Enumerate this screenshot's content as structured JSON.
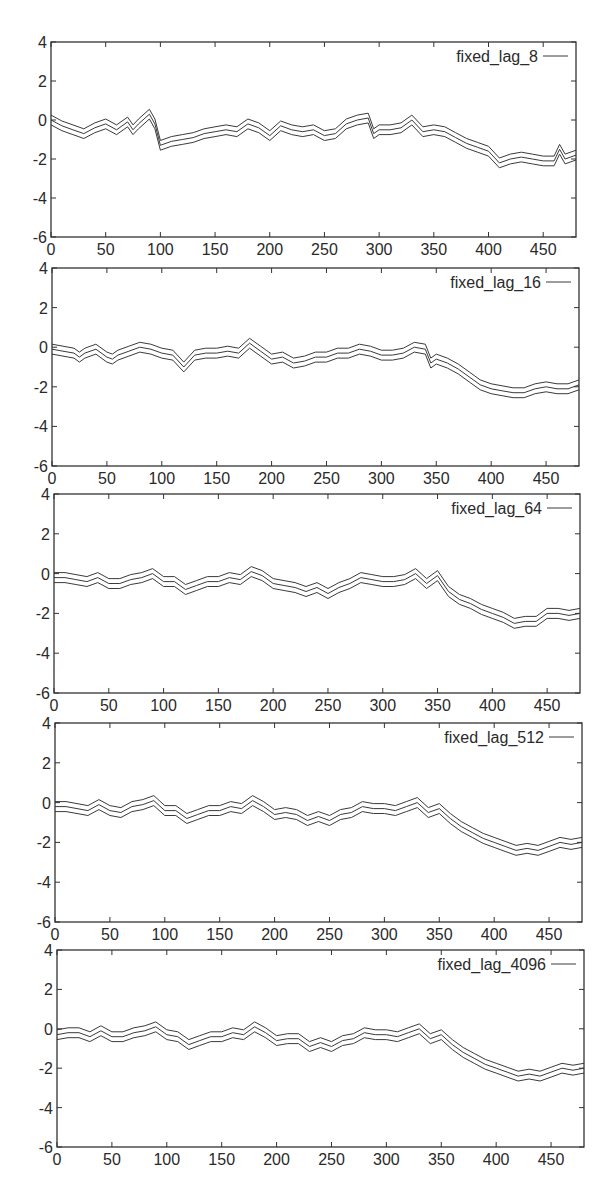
{
  "chart_data": [
    {
      "type": "line",
      "title": "",
      "legend": [
        "fixed_lag_8"
      ],
      "legend_position": "top-right",
      "xlabel": "",
      "ylabel": "",
      "xlim": [
        0,
        480
      ],
      "ylim": [
        -6,
        4
      ],
      "xticks": [
        0,
        50,
        100,
        150,
        200,
        250,
        300,
        350,
        400,
        450
      ],
      "yticks": [
        4,
        2,
        0,
        -2,
        -4,
        -6
      ],
      "grid": false,
      "band_offset": 0.25,
      "x": [
        0,
        10,
        20,
        30,
        40,
        50,
        60,
        70,
        75,
        80,
        90,
        95,
        100,
        110,
        120,
        130,
        140,
        150,
        160,
        170,
        180,
        190,
        200,
        210,
        220,
        230,
        240,
        250,
        260,
        270,
        280,
        290,
        295,
        300,
        310,
        320,
        330,
        340,
        350,
        360,
        370,
        380,
        390,
        400,
        410,
        420,
        430,
        440,
        450,
        460,
        465,
        470,
        480
      ],
      "series": [
        {
          "name": "fixed_lag_8",
          "values": [
            0.0,
            -0.3,
            -0.5,
            -0.7,
            -0.4,
            -0.2,
            -0.5,
            -0.1,
            -0.5,
            -0.2,
            0.3,
            -0.2,
            -1.3,
            -1.1,
            -1.0,
            -0.9,
            -0.7,
            -0.6,
            -0.5,
            -0.6,
            -0.2,
            -0.4,
            -0.8,
            -0.3,
            -0.5,
            -0.6,
            -0.5,
            -0.8,
            -0.7,
            -0.2,
            0.0,
            0.1,
            -0.7,
            -0.5,
            -0.5,
            -0.4,
            0.0,
            -0.6,
            -0.5,
            -0.6,
            -0.9,
            -1.2,
            -1.4,
            -1.6,
            -2.2,
            -2.0,
            -1.9,
            -2.0,
            -2.1,
            -2.1,
            -1.5,
            -2.0,
            -1.8
          ]
        }
      ]
    },
    {
      "type": "line",
      "title": "",
      "legend": [
        "fixed_lag_16"
      ],
      "legend_position": "top-right",
      "xlabel": "",
      "ylabel": "",
      "xlim": [
        0,
        480
      ],
      "ylim": [
        -6,
        4
      ],
      "xticks": [
        0,
        50,
        100,
        150,
        200,
        250,
        300,
        350,
        400,
        450
      ],
      "yticks": [
        4,
        2,
        0,
        -2,
        -4,
        -6
      ],
      "grid": false,
      "band_offset": 0.25,
      "x": [
        0,
        10,
        20,
        25,
        30,
        40,
        50,
        55,
        60,
        70,
        80,
        90,
        100,
        110,
        120,
        130,
        140,
        150,
        160,
        170,
        180,
        190,
        200,
        210,
        220,
        230,
        240,
        250,
        260,
        270,
        280,
        290,
        300,
        310,
        320,
        330,
        340,
        345,
        350,
        360,
        370,
        380,
        390,
        400,
        410,
        420,
        430,
        440,
        450,
        460,
        470,
        480
      ],
      "series": [
        {
          "name": "fixed_lag_16",
          "values": [
            -0.1,
            -0.2,
            -0.3,
            -0.5,
            -0.3,
            -0.1,
            -0.5,
            -0.6,
            -0.4,
            -0.2,
            0.0,
            -0.1,
            -0.3,
            -0.4,
            -1.0,
            -0.4,
            -0.3,
            -0.3,
            -0.2,
            -0.3,
            0.2,
            -0.2,
            -0.6,
            -0.5,
            -0.8,
            -0.7,
            -0.5,
            -0.5,
            -0.3,
            -0.3,
            -0.1,
            -0.2,
            -0.4,
            -0.4,
            -0.3,
            0.0,
            -0.1,
            -0.8,
            -0.6,
            -0.8,
            -1.1,
            -1.5,
            -1.9,
            -2.1,
            -2.2,
            -2.3,
            -2.3,
            -2.1,
            -2.0,
            -2.1,
            -2.1,
            -1.9
          ]
        }
      ]
    },
    {
      "type": "line",
      "title": "",
      "legend": [
        "fixed_lag_64"
      ],
      "legend_position": "top-right",
      "xlabel": "",
      "ylabel": "",
      "xlim": [
        0,
        480
      ],
      "ylim": [
        -6,
        4
      ],
      "xticks": [
        0,
        50,
        100,
        150,
        200,
        250,
        300,
        350,
        400,
        450
      ],
      "yticks": [
        4,
        2,
        0,
        -2,
        -4,
        -6
      ],
      "grid": false,
      "band_offset": 0.25,
      "x": [
        0,
        10,
        20,
        30,
        40,
        50,
        60,
        70,
        80,
        90,
        100,
        110,
        120,
        130,
        140,
        150,
        160,
        170,
        180,
        190,
        200,
        210,
        220,
        230,
        240,
        250,
        260,
        270,
        280,
        290,
        300,
        310,
        320,
        330,
        340,
        350,
        360,
        370,
        380,
        390,
        400,
        410,
        420,
        430,
        440,
        450,
        460,
        470,
        480
      ],
      "series": [
        {
          "name": "fixed_lag_64",
          "values": [
            -0.2,
            -0.2,
            -0.3,
            -0.4,
            -0.2,
            -0.5,
            -0.5,
            -0.3,
            -0.2,
            0.0,
            -0.4,
            -0.4,
            -0.8,
            -0.6,
            -0.4,
            -0.4,
            -0.2,
            -0.3,
            0.1,
            -0.1,
            -0.5,
            -0.6,
            -0.7,
            -0.9,
            -0.7,
            -1.0,
            -0.7,
            -0.5,
            -0.2,
            -0.3,
            -0.4,
            -0.4,
            -0.3,
            0.0,
            -0.5,
            -0.1,
            -0.9,
            -1.3,
            -1.5,
            -1.8,
            -2.0,
            -2.2,
            -2.5,
            -2.4,
            -2.4,
            -2.0,
            -2.0,
            -2.1,
            -2.0
          ]
        }
      ]
    },
    {
      "type": "line",
      "title": "",
      "legend": [
        "fixed_lag_512"
      ],
      "legend_position": "top-right",
      "xlabel": "",
      "ylabel": "",
      "xlim": [
        0,
        480
      ],
      "ylim": [
        -6,
        4
      ],
      "xticks": [
        0,
        50,
        100,
        150,
        200,
        250,
        300,
        350,
        400,
        450
      ],
      "yticks": [
        4,
        2,
        0,
        -2,
        -4,
        -6
      ],
      "grid": false,
      "band_offset": 0.25,
      "x": [
        0,
        10,
        20,
        30,
        40,
        50,
        60,
        70,
        80,
        90,
        100,
        110,
        120,
        130,
        140,
        150,
        160,
        170,
        180,
        190,
        200,
        210,
        220,
        230,
        240,
        250,
        260,
        270,
        280,
        290,
        300,
        310,
        320,
        330,
        340,
        350,
        360,
        370,
        380,
        390,
        400,
        410,
        420,
        430,
        440,
        450,
        460,
        470,
        480
      ],
      "series": [
        {
          "name": "fixed_lag_512",
          "values": [
            -0.2,
            -0.2,
            -0.3,
            -0.4,
            -0.1,
            -0.4,
            -0.5,
            -0.2,
            -0.1,
            0.1,
            -0.4,
            -0.4,
            -0.8,
            -0.6,
            -0.4,
            -0.4,
            -0.2,
            -0.3,
            0.1,
            -0.2,
            -0.6,
            -0.5,
            -0.6,
            -0.9,
            -0.7,
            -0.9,
            -0.6,
            -0.5,
            -0.2,
            -0.3,
            -0.3,
            -0.4,
            -0.2,
            0.0,
            -0.5,
            -0.3,
            -0.8,
            -1.2,
            -1.5,
            -1.8,
            -2.0,
            -2.2,
            -2.4,
            -2.3,
            -2.4,
            -2.2,
            -2.0,
            -2.1,
            -2.0
          ]
        }
      ]
    },
    {
      "type": "line",
      "title": "",
      "legend": [
        "fixed_lag_4096"
      ],
      "legend_position": "top-right",
      "xlabel": "",
      "ylabel": "",
      "xlim": [
        0,
        480
      ],
      "ylim": [
        -6,
        4
      ],
      "xticks": [
        0,
        50,
        100,
        150,
        200,
        250,
        300,
        350,
        400,
        450
      ],
      "yticks": [
        4,
        2,
        0,
        -2,
        -4,
        -6
      ],
      "grid": false,
      "band_offset": 0.25,
      "x": [
        0,
        10,
        20,
        30,
        40,
        50,
        60,
        70,
        80,
        90,
        100,
        110,
        120,
        130,
        140,
        150,
        160,
        170,
        180,
        190,
        200,
        210,
        220,
        230,
        240,
        250,
        260,
        270,
        280,
        290,
        300,
        310,
        320,
        330,
        340,
        350,
        360,
        370,
        380,
        390,
        400,
        410,
        420,
        430,
        440,
        450,
        460,
        470,
        480
      ],
      "series": [
        {
          "name": "fixed_lag_4096",
          "values": [
            -0.3,
            -0.2,
            -0.2,
            -0.4,
            -0.1,
            -0.4,
            -0.4,
            -0.2,
            -0.1,
            0.1,
            -0.3,
            -0.4,
            -0.8,
            -0.6,
            -0.4,
            -0.4,
            -0.2,
            -0.3,
            0.1,
            -0.2,
            -0.6,
            -0.5,
            -0.5,
            -0.9,
            -0.7,
            -0.9,
            -0.6,
            -0.5,
            -0.2,
            -0.3,
            -0.3,
            -0.4,
            -0.2,
            0.0,
            -0.5,
            -0.3,
            -0.8,
            -1.2,
            -1.5,
            -1.8,
            -2.0,
            -2.2,
            -2.4,
            -2.3,
            -2.4,
            -2.2,
            -2.0,
            -2.1,
            -2.0
          ]
        }
      ]
    }
  ],
  "panels": [
    {
      "legend_label": "fixed_lag_8"
    },
    {
      "legend_label": "fixed_lag_16"
    },
    {
      "legend_label": "fixed_lag_64"
    },
    {
      "legend_label": "fixed_lag_512"
    },
    {
      "legend_label": "fixed_lag_4096"
    }
  ],
  "layout": {
    "frames": [
      {
        "left": 51,
        "top": 42,
        "right": 576,
        "bottom": 237
      },
      {
        "left": 52,
        "top": 268,
        "right": 579,
        "bottom": 466
      },
      {
        "left": 54,
        "top": 494,
        "right": 580,
        "bottom": 693
      },
      {
        "left": 55,
        "top": 723,
        "right": 582,
        "bottom": 922
      },
      {
        "left": 57,
        "top": 950,
        "right": 584,
        "bottom": 1147
      }
    ]
  }
}
